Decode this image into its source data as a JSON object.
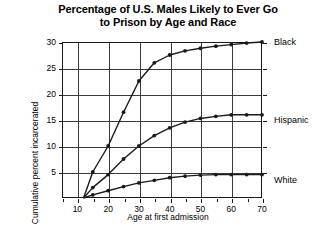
{
  "title": {
    "line1": "Percentage of U.S. Males Likely to Ever Go",
    "line2": "to Prison by Age and Race"
  },
  "axes": {
    "xlabel": "Age at first admission",
    "ylabel": "Cumulative percent incarcerated",
    "xticks": [
      "10",
      "20",
      "30",
      "40",
      "50",
      "60",
      "70"
    ],
    "yticks": [
      "5",
      "10",
      "15",
      "20",
      "25",
      "30"
    ]
  },
  "series_labels": {
    "black": "Black",
    "hispanic": "Hispanic",
    "white": "White"
  },
  "chart_data": {
    "type": "line",
    "title": "Percentage of U.S. Males Likely to Ever Go to Prison by Age and Race",
    "xlabel": "Age at first admission",
    "ylabel": "Cumulative percent incarcerated",
    "xlim": [
      5,
      70
    ],
    "ylim": [
      0,
      30
    ],
    "xtick_values": [
      10,
      20,
      30,
      40,
      50,
      60,
      70
    ],
    "xminor_tick_values": [
      5,
      15,
      25,
      35,
      45,
      55,
      65
    ],
    "ytick_values": [
      5,
      10,
      15,
      20,
      25,
      30
    ],
    "grid": true,
    "legend_position": "right-of-axis-at-line-end",
    "x": [
      12,
      15,
      20,
      25,
      30,
      35,
      40,
      45,
      50,
      55,
      60,
      65,
      70
    ],
    "series": [
      {
        "name": "Black",
        "color": "#1a1a1a",
        "marker": "filled-circle",
        "values": [
          0,
          5.0,
          10.0,
          16.5,
          22.5,
          26.0,
          27.5,
          28.3,
          28.8,
          29.2,
          29.5,
          29.8,
          30.0
        ]
      },
      {
        "name": "Hispanic",
        "color": "#1a1a1a",
        "marker": "filled-circle",
        "values": [
          0,
          2.0,
          4.5,
          7.5,
          10.0,
          12.0,
          13.5,
          14.6,
          15.3,
          15.7,
          16.0,
          16.0,
          16.0
        ]
      },
      {
        "name": "White",
        "color": "#1a1a1a",
        "marker": "filled-circle",
        "values": [
          0,
          0.6,
          1.4,
          2.2,
          2.9,
          3.4,
          3.9,
          4.2,
          4.4,
          4.5,
          4.5,
          4.5,
          4.5
        ]
      }
    ]
  }
}
